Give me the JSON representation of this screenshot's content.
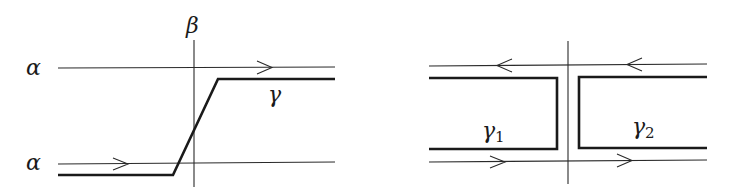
{
  "left_diagram": {
    "labels": {
      "beta": "β",
      "alpha_top": "α",
      "alpha_bottom": "α",
      "gamma": "γ"
    },
    "description": "Curve γ crosses vertical β from bottom α line to top α line"
  },
  "right_diagram": {
    "labels": {
      "gamma1": "γ",
      "gamma1_sub": "1",
      "gamma2": "γ",
      "gamma2_sub": "2"
    },
    "description": "Curve split into γ1 and γ2 on either side of the vertical line"
  },
  "colors": {
    "stroke": "#1a1a1a",
    "background": "#ffffff"
  }
}
